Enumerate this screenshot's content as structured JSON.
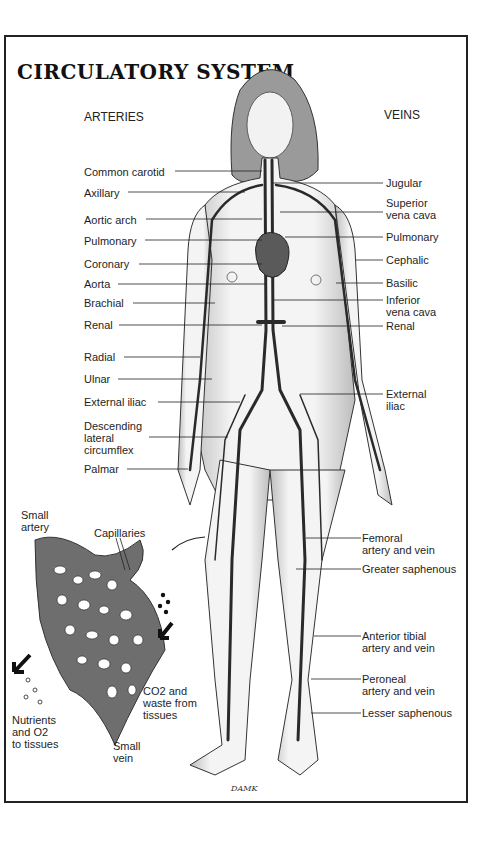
{
  "diagram": {
    "title": "CIRCULATORY SYSTEM",
    "column_headers": {
      "left": "ARTERIES",
      "right": "VEINS"
    },
    "artery_labels": [
      {
        "text": "Common carotid",
        "y": 171
      },
      {
        "text": "Axillary",
        "y": 192
      },
      {
        "text": "Aortic arch",
        "y": 219
      },
      {
        "text": "Pulmonary",
        "y": 240
      },
      {
        "text": "Coronary",
        "y": 263
      },
      {
        "text": "Aorta",
        "y": 283
      },
      {
        "text": "Brachial",
        "y": 302
      },
      {
        "text": "Renal",
        "y": 324
      },
      {
        "text": "Radial",
        "y": 357
      },
      {
        "text": "Ulnar",
        "y": 379
      },
      {
        "text": "External iliac",
        "y": 402
      },
      {
        "text": "Descending\nlateral\ncircumflex",
        "y": 420
      },
      {
        "text": "Palmar",
        "y": 469
      }
    ],
    "vein_labels": [
      {
        "text": "Jugular",
        "y": 177
      },
      {
        "text": "Superior\nvena cava",
        "y": 197
      },
      {
        "text": "Pulmonary",
        "y": 230
      },
      {
        "text": "Cephalic",
        "y": 253
      },
      {
        "text": "Basilic",
        "y": 276
      },
      {
        "text": "Inferior\nvena cava",
        "y": 293
      },
      {
        "text": "Renal",
        "y": 321
      },
      {
        "text": "External\niliac",
        "y": 387
      },
      {
        "text": "Femoral\nartery and vein",
        "y": 531
      },
      {
        "text": "Greater saphenous",
        "y": 563
      },
      {
        "text": "Anterior tibial\nartery and vein",
        "y": 630
      },
      {
        "text": "Peroneal\nartery and vein",
        "y": 672
      },
      {
        "text": "Lesser saphenous",
        "y": 707
      }
    ],
    "inset": {
      "labels": {
        "small_artery": "Small\nartery",
        "capillaries": "Capillaries",
        "co2_waste": "CO2 and\nwaste from\ntissues",
        "nutrients": "Nutrients\nand O2\nto tissues",
        "small_vein": "Small\nvein"
      }
    },
    "signature": "DAMK",
    "colors": {
      "vessel": "#2a2a2a",
      "skin_shade": "#cfcfcf",
      "hair": "#8a8a8a",
      "border": "#222222"
    }
  }
}
